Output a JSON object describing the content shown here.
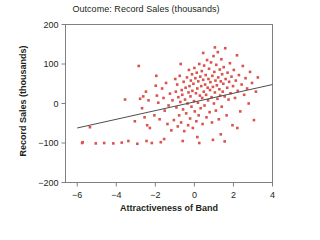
{
  "chart_data": {
    "type": "scatter",
    "title": "Outcome: Record Sales (thousands)",
    "xlabel": "Attractiveness of Band",
    "ylabel": "Record Sales (thousands)",
    "xlim": [
      -6.6,
      4.0
    ],
    "ylim": [
      -200,
      200
    ],
    "xticks": [
      -6,
      -4,
      -2,
      0,
      2,
      4
    ],
    "xticklabels": [
      "−6",
      "−4",
      "−2",
      "0",
      "2",
      "4"
    ],
    "yticks": [
      -200,
      -100,
      0,
      100,
      200
    ],
    "yticklabels": [
      "−200",
      "−100",
      "0",
      "100",
      "200"
    ],
    "grid": false,
    "legend": null,
    "marker": {
      "shape": "square",
      "size": 2.6,
      "color": "#d9544c"
    },
    "trendline": {
      "label": "regression-line",
      "color": "#4d4d4d",
      "x": [
        -6.0,
        4.0
      ],
      "y": [
        -62,
        48
      ]
    },
    "points": [
      [
        -5.72,
        -98
      ],
      [
        -5.75,
        -100
      ],
      [
        -5.35,
        -60
      ],
      [
        -5.05,
        -101
      ],
      [
        -4.62,
        -100
      ],
      [
        -4.15,
        -101
      ],
      [
        -3.72,
        -99
      ],
      [
        -3.38,
        -95
      ],
      [
        -3.05,
        -45
      ],
      [
        -2.92,
        -102
      ],
      [
        -2.85,
        95
      ],
      [
        -2.78,
        12
      ],
      [
        -2.62,
        18
      ],
      [
        -2.55,
        -35
      ],
      [
        -2.48,
        30
      ],
      [
        -2.42,
        -55
      ],
      [
        -2.35,
        8
      ],
      [
        -2.28,
        -62
      ],
      [
        -2.18,
        -100
      ],
      [
        -2.05,
        -30
      ],
      [
        -1.98,
        45
      ],
      [
        -1.92,
        20
      ],
      [
        -1.85,
        2
      ],
      [
        -1.78,
        -40
      ],
      [
        -1.72,
        -98
      ],
      [
        -1.65,
        38
      ],
      [
        -1.58,
        14
      ],
      [
        -1.52,
        -18
      ],
      [
        -1.45,
        52
      ],
      [
        -1.38,
        -52
      ],
      [
        -1.32,
        -5
      ],
      [
        -1.25,
        25
      ],
      [
        -1.18,
        -68
      ],
      [
        -1.12,
        8
      ],
      [
        -1.05,
        -42
      ],
      [
        -0.98,
        62
      ],
      [
        -0.95,
        30
      ],
      [
        -0.92,
        -10
      ],
      [
        -0.88,
        48
      ],
      [
        -0.85,
        -58
      ],
      [
        -0.82,
        16
      ],
      [
        -0.78,
        -30
      ],
      [
        -0.75,
        70
      ],
      [
        -0.72,
        4
      ],
      [
        -0.68,
        -48
      ],
      [
        -0.65,
        34
      ],
      [
        -0.62,
        22
      ],
      [
        -0.58,
        -15
      ],
      [
        -0.55,
        55
      ],
      [
        -0.52,
        -70
      ],
      [
        -0.48,
        10
      ],
      [
        -0.45,
        40
      ],
      [
        -0.42,
        -25
      ],
      [
        -0.38,
        66
      ],
      [
        -0.35,
        0
      ],
      [
        -0.32,
        -55
      ],
      [
        -0.3,
        28
      ],
      [
        -0.28,
        85
      ],
      [
        -0.25,
        44
      ],
      [
        -0.22,
        -38
      ],
      [
        -0.2,
        18
      ],
      [
        -0.18,
        58
      ],
      [
        -0.15,
        -8
      ],
      [
        -0.12,
        74
      ],
      [
        -0.1,
        32
      ],
      [
        -0.08,
        -62
      ],
      [
        -0.05,
        50
      ],
      [
        -0.02,
        6
      ],
      [
        0.0,
        90
      ],
      [
        0.02,
        -20
      ],
      [
        0.05,
        64
      ],
      [
        0.08,
        26
      ],
      [
        0.1,
        -45
      ],
      [
        0.12,
        78
      ],
      [
        0.15,
        38
      ],
      [
        0.18,
        2
      ],
      [
        0.2,
        56
      ],
      [
        0.22,
        -30
      ],
      [
        0.25,
        100
      ],
      [
        0.28,
        20
      ],
      [
        0.3,
        68
      ],
      [
        0.32,
        -12
      ],
      [
        0.35,
        44
      ],
      [
        0.38,
        82
      ],
      [
        0.4,
        14
      ],
      [
        0.42,
        -52
      ],
      [
        0.45,
        60
      ],
      [
        0.48,
        30
      ],
      [
        0.5,
        96
      ],
      [
        0.52,
        -5
      ],
      [
        0.55,
        48
      ],
      [
        0.58,
        72
      ],
      [
        0.6,
        22
      ],
      [
        0.62,
        -35
      ],
      [
        0.65,
        110
      ],
      [
        0.68,
        40
      ],
      [
        0.7,
        8
      ],
      [
        0.72,
        62
      ],
      [
        0.75,
        88
      ],
      [
        0.78,
        -22
      ],
      [
        0.8,
        34
      ],
      [
        0.82,
        54
      ],
      [
        0.85,
        104
      ],
      [
        0.88,
        16
      ],
      [
        0.9,
        -48
      ],
      [
        0.92,
        70
      ],
      [
        0.95,
        42
      ],
      [
        0.98,
        120
      ],
      [
        1.0,
        0
      ],
      [
        1.02,
        80
      ],
      [
        1.05,
        28
      ],
      [
        1.08,
        58
      ],
      [
        1.1,
        -18
      ],
      [
        1.12,
        98
      ],
      [
        1.15,
        46
      ],
      [
        1.18,
        12
      ],
      [
        1.2,
        130
      ],
      [
        1.22,
        66
      ],
      [
        1.25,
        -40
      ],
      [
        1.28,
        36
      ],
      [
        1.3,
        86
      ],
      [
        1.32,
        20
      ],
      [
        1.35,
        56
      ],
      [
        1.38,
        112
      ],
      [
        1.4,
        -8
      ],
      [
        1.42,
        74
      ],
      [
        1.45,
        30
      ],
      [
        1.48,
        50
      ],
      [
        1.5,
        92
      ],
      [
        1.55,
        18
      ],
      [
        1.58,
        140
      ],
      [
        1.6,
        62
      ],
      [
        1.65,
        -30
      ],
      [
        1.68,
        40
      ],
      [
        1.7,
        78
      ],
      [
        1.75,
        10
      ],
      [
        1.78,
        55
      ],
      [
        1.82,
        102
      ],
      [
        1.85,
        26
      ],
      [
        1.9,
        68
      ],
      [
        1.95,
        -55
      ],
      [
        1.98,
        44
      ],
      [
        2.02,
        85
      ],
      [
        2.08,
        14
      ],
      [
        2.12,
        58
      ],
      [
        2.18,
        122
      ],
      [
        2.22,
        32
      ],
      [
        2.28,
        72
      ],
      [
        2.35,
        -20
      ],
      [
        2.42,
        48
      ],
      [
        2.48,
        95
      ],
      [
        2.55,
        22
      ],
      [
        2.62,
        64
      ],
      [
        2.7,
        38
      ],
      [
        2.78,
        0
      ],
      [
        2.85,
        80
      ],
      [
        2.95,
        52
      ],
      [
        3.05,
        -42
      ],
      [
        3.15,
        30
      ],
      [
        3.25,
        66
      ],
      [
        -2.45,
        -95
      ],
      [
        -1.55,
        -90
      ],
      [
        -0.6,
        -95
      ],
      [
        0.25,
        -100
      ],
      [
        0.95,
        -92
      ],
      [
        1.55,
        -96
      ],
      [
        -3.55,
        10
      ],
      [
        -2.68,
        -12
      ],
      [
        0.45,
        128
      ],
      [
        1.05,
        142
      ],
      [
        -1.95,
        70
      ],
      [
        2.2,
        -62
      ],
      [
        1.35,
        -78
      ],
      [
        -0.7,
        100
      ],
      [
        0.15,
        -85
      ]
    ]
  }
}
